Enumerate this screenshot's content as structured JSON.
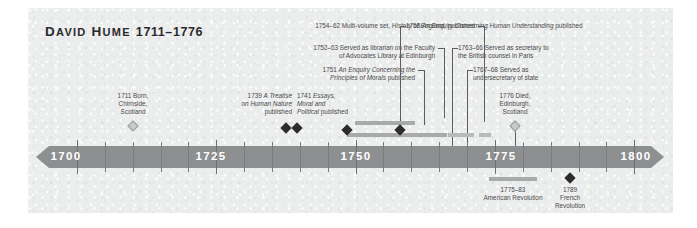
{
  "title": {
    "name": "David Hume",
    "name_first": "D",
    "name_first_rest": "AVID",
    "name_second": "H",
    "name_second_rest": "UME",
    "years": "1711–1776",
    "full": "DAVID HUME 1711–1776"
  },
  "axis": {
    "start_year": 1695,
    "end_year": 1803,
    "labels": [
      {
        "year": 1700,
        "text": "1700"
      },
      {
        "year": 1725,
        "text": "1725"
      },
      {
        "year": 1750,
        "text": "1750"
      },
      {
        "year": 1775,
        "text": "1775"
      },
      {
        "year": 1800,
        "text": "1800"
      }
    ],
    "major_ticks": [
      1700,
      1725,
      1750,
      1775,
      1800
    ],
    "minor_ticks": [
      1705,
      1710,
      1715,
      1720,
      1730,
      1735,
      1740,
      1745,
      1755,
      1760,
      1765,
      1770,
      1780,
      1785,
      1790,
      1795
    ]
  },
  "events": [
    {
      "id": "born",
      "year": 1711,
      "marker": "hollow-diamond",
      "lines": [
        "1711 Born,",
        "Chirnside,",
        "Scotland"
      ],
      "align": "center"
    },
    {
      "id": "treatise",
      "year": 1739,
      "marker": "solid-diamond",
      "lines": [
        "1739 A Treatise",
        "on Human Nature",
        "published"
      ],
      "italic_parts": [
        "A Treatise",
        "on Human Nature"
      ],
      "align": "right"
    },
    {
      "id": "essays",
      "year": 1741,
      "marker": "solid-diamond",
      "lines": [
        "1741 Essays,",
        "Moral and",
        "Political published"
      ],
      "italic_parts": [
        "Essays,",
        "Moral and",
        "Political"
      ],
      "align": "left"
    },
    {
      "id": "enquiry-morals",
      "year": 1751,
      "marker": "solid-diamond",
      "lines": [
        "1751 An Enquiry Concerning the",
        "Principles of Morals published"
      ],
      "italic_parts": [
        "An Enquiry Concerning the",
        "Principles of Morals"
      ],
      "align": "right"
    },
    {
      "id": "librarian",
      "year_start": 1752,
      "year_end": 1763,
      "marker": "span-bar",
      "lines": [
        "1752–63 Served as librarian on the Faculty",
        "of Advocates Library at Edinburgh"
      ],
      "align": "right"
    },
    {
      "id": "history-england",
      "year_start": 1754,
      "year_end": 1762,
      "marker": "span-bar",
      "lines": [
        "1754–62 Multi-volume set, History of England, published"
      ],
      "italic_parts": [
        "History of England,"
      ],
      "align": "right"
    },
    {
      "id": "enquiry-understanding",
      "year": 1758,
      "marker": "solid-diamond",
      "lines": [
        "1758 An Enquiry Concerning Human Understanding published"
      ],
      "italic_parts": [
        "An Enquiry Concerning Human Understanding"
      ],
      "align": "left"
    },
    {
      "id": "secretary-paris",
      "year_start": 1763,
      "year_end": 1766,
      "marker": "span-bar",
      "lines": [
        "1763–66 Served as secretary to",
        "the British counsel in Paris"
      ],
      "align": "left"
    },
    {
      "id": "undersecretary",
      "year_start": 1767,
      "year_end": 1768,
      "marker": "span-bar",
      "lines": [
        "1767–68 Served as",
        "undersecretary of state"
      ],
      "align": "left"
    },
    {
      "id": "died",
      "year": 1776,
      "marker": "hollow-diamond",
      "lines": [
        "1776 Died,",
        "Edinburgh,",
        "Scotland"
      ],
      "align": "center"
    }
  ],
  "context_events": [
    {
      "id": "american-revolution",
      "year_start": 1775,
      "year_end": 1783,
      "marker": "span-bar",
      "lines": [
        "1775–83",
        "American Revolution"
      ]
    },
    {
      "id": "french-revolution",
      "year": 1789,
      "marker": "solid-diamond",
      "lines": [
        "1789",
        "French",
        "Revolution"
      ]
    }
  ],
  "colors": {
    "panel_background": "#eceded",
    "axis_bar": "#8e8f91",
    "axis_text": "#ffffff",
    "marker_solid": "#2c2c2e",
    "marker_hollow": "#c9cacb",
    "span_bar": "#a9aaac",
    "label_text": "#4a4a4c",
    "title_text": "#2a2a2c",
    "connector": "#5d5d5f"
  }
}
